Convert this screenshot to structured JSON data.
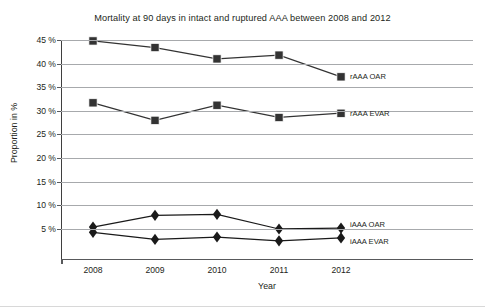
{
  "chart_data": {
    "type": "line",
    "title": "Mortality at 90 days in intact and ruptured AAA between 2008 and 2012",
    "xlabel": "Year",
    "ylabel": "Proportion in %",
    "categories": [
      "2008",
      "2009",
      "2010",
      "2011",
      "2012"
    ],
    "x": [
      2008,
      2009,
      2010,
      2011,
      2012
    ],
    "ylim": [
      0,
      45
    ],
    "ytick_labels": [
      "45 %",
      "40 %",
      "35 %",
      "30 %",
      "25 %",
      "20 %",
      "15 %",
      "10 %",
      "5 %"
    ],
    "ytick_values": [
      45,
      40,
      35,
      30,
      25,
      20,
      15,
      10,
      5
    ],
    "grid": "horizontal",
    "legend_position": "right-inline",
    "series": [
      {
        "name": "rAAA OAR",
        "marker": "square",
        "color": "#333333",
        "values": [
          44.8,
          43.4,
          41.0,
          41.8,
          37.2
        ]
      },
      {
        "name": "rAAA EVAR",
        "marker": "square",
        "color": "#333333",
        "values": [
          31.7,
          28.0,
          31.2,
          28.6,
          29.5
        ]
      },
      {
        "name": "iAAA OAR",
        "marker": "diamond",
        "color": "#1a1a1a",
        "values": [
          5.4,
          7.9,
          8.1,
          5.0,
          5.2
        ]
      },
      {
        "name": "iAAA EVAR",
        "marker": "diamond",
        "color": "#1a1a1a",
        "values": [
          4.3,
          2.8,
          3.3,
          2.5,
          3.1
        ]
      }
    ]
  }
}
